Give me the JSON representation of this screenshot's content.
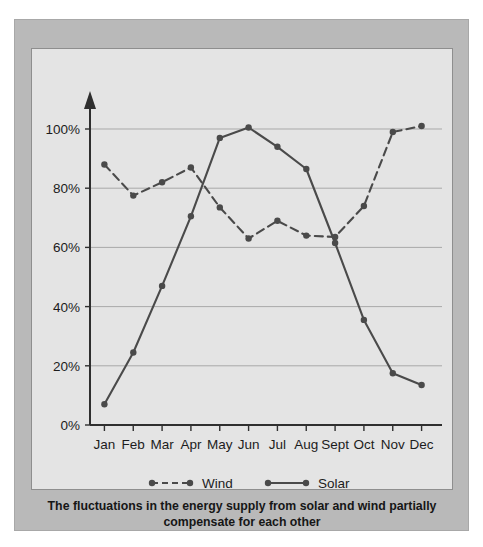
{
  "caption": {
    "line1": "The fluctuations in the energy supply from solar and wind partially",
    "line2": "compensate for each other"
  },
  "chart_data": {
    "type": "line",
    "title": "",
    "xlabel": "",
    "ylabel": "",
    "categories": [
      "Jan",
      "Feb",
      "Mar",
      "Apr",
      "May",
      "Jun",
      "Jul",
      "Aug",
      "Sept",
      "Oct",
      "Nov",
      "Dec"
    ],
    "ytick_labels": [
      "0%",
      "20%",
      "40%",
      "60%",
      "80%",
      "100%"
    ],
    "ytick_values": [
      0,
      20,
      40,
      60,
      80,
      100
    ],
    "ylim": [
      0,
      108
    ],
    "grid": "horizontal",
    "legend_position": "bottom-center",
    "series": [
      {
        "name": "Wind",
        "style": "dashed",
        "marker": "circle",
        "color": "#4a4a4a",
        "values": [
          88,
          77.5,
          82,
          87,
          73.5,
          63,
          69,
          64,
          63.5,
          74,
          99,
          101
        ]
      },
      {
        "name": "Solar",
        "style": "solid",
        "marker": "circle",
        "color": "#4a4a4a",
        "values": [
          7,
          24.5,
          47,
          70.5,
          97,
          100.5,
          94,
          86.5,
          61.5,
          35.5,
          17.5,
          13.5
        ]
      }
    ]
  },
  "colors": {
    "frame": "#b9b9b9",
    "panel": "#e4e4e4",
    "axis": "#2f2f2f",
    "grid": "#a9a9a9",
    "series": "#4a4a4a"
  }
}
